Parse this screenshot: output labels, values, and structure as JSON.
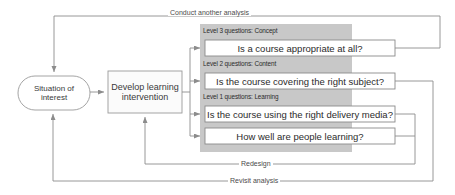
{
  "diagram": {
    "colors": {
      "panel_fill": "#c8c8c8",
      "box_fill": "#ffffff",
      "box_stroke": "#808080",
      "line": "#8c8c8c",
      "text": "#333333"
    },
    "nodes": [
      {
        "id": "situation",
        "label": "Situation of\ninterest",
        "shape": "stadium"
      },
      {
        "id": "intervention",
        "label": "Develop learning\nintervention",
        "shape": "rectangle"
      }
    ],
    "panel": {
      "groups": [
        {
          "level_label": "Level 3 questions: Concept",
          "questions": [
            "Is a course appropriate at all?"
          ]
        },
        {
          "level_label": "Level 2 questions: Content",
          "questions": [
            "Is the course covering the right subject?"
          ]
        },
        {
          "level_label": "Level 1 questions: Learning",
          "questions": [
            "Is the course using the right delivery media?",
            "How well are people learning?"
          ]
        }
      ]
    },
    "edge_labels": {
      "conduct": "Conduct another analysis",
      "redesign": "Redesign",
      "revisit": "Revisit analysis"
    }
  }
}
